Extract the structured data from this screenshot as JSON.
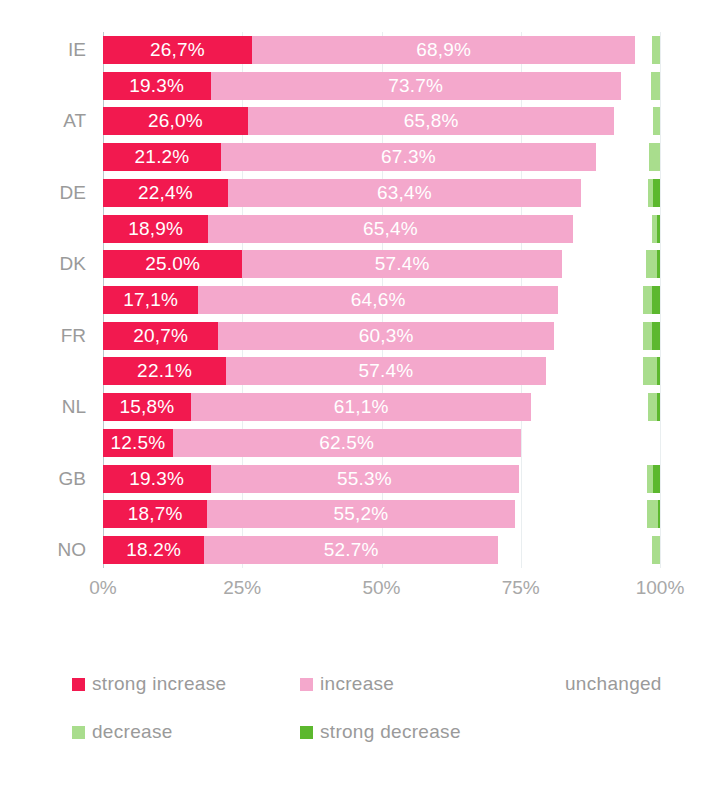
{
  "chart_data": {
    "type": "bar",
    "orientation": "horizontal",
    "stacked": true,
    "stacked_100": true,
    "title": "",
    "subtitle": "",
    "xlabel": "",
    "ylabel": "",
    "xlim": [
      0,
      100
    ],
    "xticks": [
      0,
      25,
      50,
      75,
      100
    ],
    "xtick_labels": [
      "0%",
      "25%",
      "50%",
      "75%",
      "100%"
    ],
    "grid": true,
    "legend_position": "bottom",
    "decimal_separator": "comma",
    "categories": [
      "IE",
      "",
      "AT",
      "",
      "DE",
      "",
      "DK",
      "",
      "FR",
      "",
      "NL",
      "",
      "GB",
      "",
      "NO"
    ],
    "category_labels_visible": [
      "IE",
      "AT",
      "DE",
      "DK",
      "FR",
      "NL",
      "GB",
      "NO"
    ],
    "series": [
      {
        "name": "strong increase",
        "color": "#f2194f",
        "values": [
          26.7,
          19.3,
          26.0,
          21.2,
          22.4,
          18.9,
          25.0,
          17.1,
          20.7,
          22.1,
          15.8,
          12.5,
          19.3,
          18.7,
          18.2
        ],
        "labels": [
          "26,7%",
          "19.3%",
          "26,0%",
          "21.2%",
          "22,4%",
          "18,9%",
          "25.0%",
          "17,1%",
          "20,7%",
          "22.1%",
          "15,8%",
          "12.5%",
          "19.3%",
          "18,7%",
          "18.2%"
        ]
      },
      {
        "name": "increase",
        "color": "#f4a8cc",
        "values": [
          68.9,
          73.7,
          65.8,
          67.3,
          63.4,
          65.4,
          57.4,
          64.6,
          60.3,
          57.4,
          61.1,
          62.5,
          55.3,
          55.2,
          52.7
        ],
        "labels": [
          "68,9%",
          "73.7%",
          "65,8%",
          "67.3%",
          "63,4%",
          "65,4%",
          "57.4%",
          "64,6%",
          "60,3%",
          "57.4%",
          "61,1%",
          "62.5%",
          "55.3%",
          "55,2%",
          "52.7%"
        ]
      },
      {
        "name": "unchanged",
        "color": "#ffffff",
        "values": [
          3.0,
          5.4,
          7.0,
          9.5,
          12.0,
          14.2,
          15.1,
          15.3,
          16.0,
          17.5,
          21.0,
          25.0,
          23.0,
          23.7,
          27.6
        ],
        "labels": [
          "",
          "",
          "",
          "",
          "",
          "",
          "",
          "",
          "",
          "",
          "",
          "",
          "",
          "",
          ""
        ]
      },
      {
        "name": "decrease",
        "color": "#a9dd8d",
        "values": [
          1.4,
          1.6,
          1.2,
          2.0,
          1.0,
          1.0,
          2.0,
          1.5,
          1.6,
          2.4,
          1.6,
          0.0,
          1.2,
          2.1,
          1.5
        ],
        "labels": [
          "",
          "",
          "",
          "",
          "",
          "",
          "",
          "",
          "",
          "",
          "",
          "",
          "",
          "",
          ""
        ]
      },
      {
        "name": "strong decrease",
        "color": "#5cb82e",
        "values": [
          0.0,
          0.0,
          0.0,
          0.0,
          1.2,
          0.5,
          0.5,
          1.5,
          1.4,
          0.6,
          0.5,
          0.0,
          1.2,
          0.3,
          0.0
        ],
        "labels": [
          "",
          "",
          "",
          "",
          "",
          "",
          "",
          "",
          "",
          "",
          "",
          "",
          "",
          "",
          ""
        ]
      }
    ]
  },
  "legend": {
    "rows": [
      [
        {
          "label": "strong increase",
          "color": "#f2194f",
          "swatch": true
        },
        {
          "label": "increase",
          "color": "#f4a8cc",
          "swatch": true
        },
        {
          "label": "unchanged",
          "color": "#ffffff",
          "swatch": false
        }
      ],
      [
        {
          "label": "decrease",
          "color": "#a9dd8d",
          "swatch": true
        },
        {
          "label": "strong decrease",
          "color": "#5cb82e",
          "swatch": true
        }
      ]
    ]
  }
}
